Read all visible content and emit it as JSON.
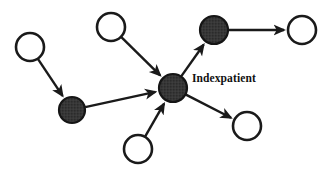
{
  "diagram": {
    "background_color": "#ffffff",
    "stroke_color": "#1a1a1a",
    "filled_node_color": "#2b2b2b",
    "hollow_node_color": "#ffffff",
    "labels": [
      {
        "id": "index-patient-label",
        "text": "Indexpatient",
        "x": 192,
        "y": 82
      }
    ],
    "nodes": [
      {
        "id": "node-top-left",
        "type": "hollow",
        "cx": 30,
        "cy": 47,
        "r": 14
      },
      {
        "id": "node-top-middle",
        "type": "hollow",
        "cx": 111,
        "cy": 27,
        "r": 14
      },
      {
        "id": "node-top-right",
        "type": "filled",
        "cx": 214,
        "cy": 30,
        "r": 14
      },
      {
        "id": "node-far-right",
        "type": "hollow",
        "cx": 302,
        "cy": 30,
        "r": 14
      },
      {
        "id": "node-lower-left",
        "type": "filled",
        "cx": 72,
        "cy": 110,
        "r": 13
      },
      {
        "id": "node-center",
        "type": "filled",
        "cx": 173,
        "cy": 88,
        "r": 14
      },
      {
        "id": "node-bottom-right",
        "type": "hollow",
        "cx": 247,
        "cy": 126,
        "r": 14
      },
      {
        "id": "node-bottom-mid",
        "type": "hollow",
        "cx": 138,
        "cy": 149,
        "r": 14
      }
    ],
    "edges": [
      {
        "id": "edge-top-left-to-lower-left",
        "from": "node-top-left",
        "to": "node-lower-left",
        "directed": true
      },
      {
        "id": "edge-lower-left-to-center",
        "from": "node-lower-left",
        "to": "node-center",
        "directed": true
      },
      {
        "id": "edge-top-middle-to-center",
        "from": "node-top-middle",
        "to": "node-center",
        "directed": true
      },
      {
        "id": "edge-bottom-mid-to-center",
        "from": "node-bottom-mid",
        "to": "node-center",
        "directed": true
      },
      {
        "id": "edge-center-to-top-right",
        "from": "node-center",
        "to": "node-top-right",
        "directed": true
      },
      {
        "id": "edge-center-to-bottom-right",
        "from": "node-center",
        "to": "node-bottom-right",
        "directed": true
      },
      {
        "id": "edge-top-right-to-far-right",
        "from": "node-top-right",
        "to": "node-far-right",
        "directed": true
      }
    ]
  }
}
